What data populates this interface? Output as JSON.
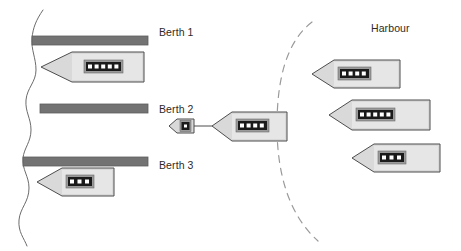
{
  "diagram": {
    "title_visible": false,
    "background_color": "#ffffff",
    "colors": {
      "berth_bar": "#737373",
      "berth_bar_stroke": "#5e5e5e",
      "hull_fill": "#d9d9d9",
      "hull_stroke": "#4d4d4d",
      "deck_fill": "#e8e8e8",
      "porthole_block": "#1a1a1a",
      "porthole_block_surround": "#9a9a9a",
      "porthole_dot": "#ffffff",
      "coastline": "#6b6b6b",
      "harbour_boundary": "#9a9a9a",
      "tow_line": "#4d4d4d",
      "text": "#2b2b2b"
    }
  },
  "labels": {
    "berth_1": "Berth 1",
    "berth_2": "Berth 2",
    "berth_3": "Berth 3",
    "harbour": "Harbour"
  },
  "berths": [
    {
      "id": "berth-1",
      "label": "Berth 1",
      "x": 32,
      "y": 36,
      "width": 116,
      "height": 9,
      "occupied": true
    },
    {
      "id": "berth-2",
      "label": "Berth 2",
      "x": 40,
      "y": 104,
      "width": 108,
      "height": 9,
      "occupied": false
    },
    {
      "id": "berth-3",
      "label": "Berth 3",
      "x": 23,
      "y": 157,
      "width": 125,
      "height": 9,
      "occupied": true
    }
  ],
  "vessels": [
    {
      "id": "ship-berth-1",
      "kind": "ship",
      "location": "Berth 1",
      "portholes": 5,
      "bow": "left"
    },
    {
      "id": "ship-berth-3",
      "kind": "ship",
      "location": "Berth 3",
      "portholes": 3,
      "bow": "left"
    },
    {
      "id": "tug-mid-channel",
      "kind": "tug",
      "location": "Channel",
      "portholes": 1,
      "bow": "left"
    },
    {
      "id": "ship-under-tow",
      "kind": "ship",
      "location": "Channel",
      "portholes": 4,
      "bow": "left"
    },
    {
      "id": "ship-harbour-1",
      "kind": "ship",
      "location": "Harbour",
      "portholes": 4,
      "bow": "left"
    },
    {
      "id": "ship-harbour-2",
      "kind": "ship",
      "location": "Harbour",
      "portholes": 5,
      "bow": "left"
    },
    {
      "id": "ship-harbour-3",
      "kind": "ship",
      "location": "Harbour",
      "portholes": 3,
      "bow": "left"
    }
  ],
  "connections": [
    {
      "id": "tow-line",
      "from": "tug-mid-channel",
      "to": "ship-under-tow",
      "style": "solid"
    }
  ],
  "boundaries": [
    {
      "id": "coastline",
      "style": "solid-wavy",
      "orientation": "vertical-left"
    },
    {
      "id": "harbour-boundary",
      "style": "dashed-arc",
      "orientation": "vertical-center"
    }
  ]
}
